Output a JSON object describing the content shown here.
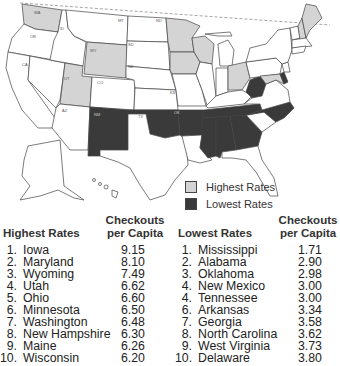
{
  "map": {
    "title": "Library checkouts per capita by state",
    "legend": {
      "highest_label": "Highest Rates",
      "lowest_label": "Lowest Rates",
      "highest_color": "#d4d4d4",
      "lowest_color": "#3a3a3a",
      "neutral_color": "#ffffff"
    },
    "highest_states": [
      "WA",
      "WY",
      "UT",
      "MN",
      "IA",
      "WI",
      "OH",
      "MD",
      "NH",
      "ME"
    ],
    "lowest_states": [
      "NM",
      "OK",
      "AR",
      "TN",
      "MS",
      "AL",
      "GA",
      "NC",
      "WV",
      "DE"
    ]
  },
  "highest": {
    "heading": "Highest Rates",
    "value_heading_line1": "Checkouts",
    "value_heading_line2": "per Capita",
    "rows": [
      {
        "rank": "1.",
        "state": "Iowa",
        "value": "9.15"
      },
      {
        "rank": "2.",
        "state": "Maryland",
        "value": "8.10"
      },
      {
        "rank": "3.",
        "state": "Wyoming",
        "value": "7.49"
      },
      {
        "rank": "4.",
        "state": "Utah",
        "value": "6.62"
      },
      {
        "rank": "5.",
        "state": "Ohio",
        "value": "6.60"
      },
      {
        "rank": "6.",
        "state": "Minnesota",
        "value": "6.50"
      },
      {
        "rank": "7.",
        "state": "Washington",
        "value": "6.48"
      },
      {
        "rank": "8.",
        "state": "New Hampshire",
        "value": "6.30"
      },
      {
        "rank": "9.",
        "state": "Maine",
        "value": "6.26"
      },
      {
        "rank": "10.",
        "state": "Wisconsin",
        "value": "6.20"
      }
    ]
  },
  "lowest": {
    "heading": "Lowest Rates",
    "value_heading_line1": "Checkouts",
    "value_heading_line2": "per Capita",
    "rows": [
      {
        "rank": "1.",
        "state": "Mississippi",
        "value": "1.71"
      },
      {
        "rank": "2.",
        "state": "Alabama",
        "value": "2.90"
      },
      {
        "rank": "3.",
        "state": "Oklahoma",
        "value": "2.98"
      },
      {
        "rank": "4.",
        "state": "New Mexico",
        "value": "3.00"
      },
      {
        "rank": "4.",
        "state": "Tennessee",
        "value": "3.00"
      },
      {
        "rank": "6.",
        "state": "Arkansas",
        "value": "3.34"
      },
      {
        "rank": "7.",
        "state": "Georgia",
        "value": "3.58"
      },
      {
        "rank": "8.",
        "state": "North Carolina",
        "value": "3.62"
      },
      {
        "rank": "9.",
        "state": "West Virginia",
        "value": "3.73"
      },
      {
        "rank": "10.",
        "state": "Delaware",
        "value": "3.80"
      }
    ]
  }
}
